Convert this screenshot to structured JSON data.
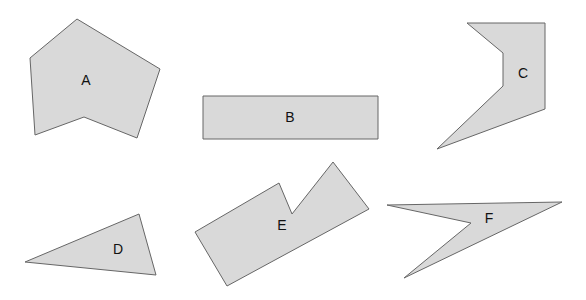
{
  "canvas": {
    "width": 586,
    "height": 300,
    "background": "#ffffff"
  },
  "style": {
    "fill": "#d9d9d9",
    "stroke": "#666666"
  },
  "shapes": [
    {
      "label": "A",
      "points": "77,19 160,69 137,138 84,117 35,135 30,58",
      "label_x": 86,
      "label_y": 80
    },
    {
      "label": "B",
      "points": "203,96 378,96 378,139 203,139",
      "label_x": 290,
      "label_y": 117
    },
    {
      "label": "C",
      "points": "467,23 545,23 545,109 437,149 503,86 503,53",
      "label_x": 523,
      "label_y": 73
    },
    {
      "label": "D",
      "points": "25,262 139,214 156,275",
      "label_x": 118,
      "label_y": 249
    },
    {
      "label": "E",
      "points": "195,232 279,183 292,214 333,162 369,209 227,286",
      "label_x": 282,
      "label_y": 225
    },
    {
      "label": "F",
      "points": "387,205 562,202 404,278 471,223",
      "label_x": 489,
      "label_y": 218
    }
  ]
}
